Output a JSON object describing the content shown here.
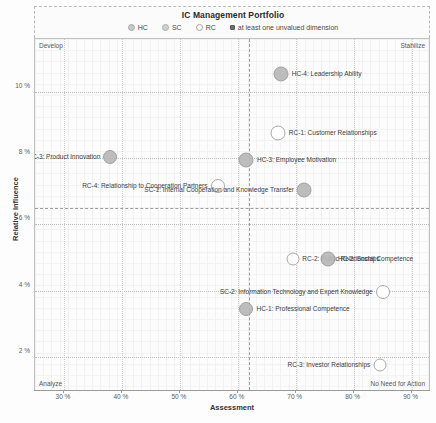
{
  "chart_data": {
    "type": "scatter",
    "title": "IC Management Portfolio",
    "xlabel": "Assessment",
    "ylabel": "Relative Influence",
    "xlim": [
      25,
      93
    ],
    "ylim": [
      1.0,
      11.6
    ],
    "xticks": [
      "30 %",
      "40 %",
      "50 %",
      "60 %",
      "70 %",
      "80 %",
      "90 %"
    ],
    "xtick_values": [
      30,
      40,
      50,
      60,
      70,
      80,
      90
    ],
    "yticks": [
      "2 %",
      "4 %",
      "6 %",
      "8 %",
      "10 %"
    ],
    "ytick_values": [
      2,
      4,
      6,
      8,
      10
    ],
    "grid": true,
    "legend_position": "top",
    "quadrant_divider_x": 62,
    "quadrant_divider_y": 6.5,
    "quadrants": {
      "top_left": "Develop",
      "top_right": "Stabilize",
      "bottom_left": "Analyze",
      "bottom_right": "No Need for Action"
    },
    "legend": [
      {
        "key": "HC",
        "label": "HC",
        "marker": "circle-grey"
      },
      {
        "key": "SC",
        "label": "SC",
        "marker": "circle-grey"
      },
      {
        "key": "RC",
        "label": "RC",
        "marker": "circle-open"
      },
      {
        "key": "unvalued",
        "label": "at least one unvalued dimension",
        "marker": "square-filled"
      }
    ],
    "points": [
      {
        "id": "HC-4",
        "label": "HC-4: Leadership Ability",
        "x": 67.5,
        "y": 10.55,
        "size": 15,
        "fill": "filled",
        "label_side": "right"
      },
      {
        "id": "RC-1",
        "label": "RC-1: Customer Relationships",
        "x": 67.0,
        "y": 8.75,
        "size": 15,
        "fill": "open",
        "label_side": "right"
      },
      {
        "id": "SC-3",
        "label": "SC-3: Product Innovation",
        "x": 38.0,
        "y": 8.05,
        "size": 14,
        "fill": "filled",
        "label_side": "left"
      },
      {
        "id": "HC-3",
        "label": "HC-3: Employee Motivation",
        "x": 61.5,
        "y": 7.95,
        "size": 15,
        "fill": "filled",
        "label_side": "right"
      },
      {
        "id": "RC-4",
        "label": "RC-4: Relationship to Cooperation Partners",
        "x": 56.5,
        "y": 7.15,
        "size": 14,
        "fill": "open",
        "label_side": "left"
      },
      {
        "id": "SC-1",
        "label": "SC-1: Internal  Cooperation and Knowledge Transfer",
        "x": 71.5,
        "y": 7.05,
        "size": 15,
        "fill": "filled",
        "label_side": "left"
      },
      {
        "id": "RC-2",
        "label": "RC-2: Public Relationships",
        "x": 69.5,
        "y": 4.95,
        "size": 13,
        "fill": "open",
        "label_side": "right"
      },
      {
        "id": "HC-2",
        "label": "HC-2: Social Competence",
        "x": 75.5,
        "y": 4.95,
        "size": 15,
        "fill": "filled",
        "label_side": "right"
      },
      {
        "id": "SC-2",
        "label": "SC-2: Information Technology and Expert Knowledge",
        "x": 85.0,
        "y": 3.95,
        "size": 14,
        "fill": "open",
        "label_side": "left"
      },
      {
        "id": "HC-1",
        "label": "HC-1: Professional Competence",
        "x": 61.5,
        "y": 3.45,
        "size": 14,
        "fill": "filled",
        "label_side": "right"
      },
      {
        "id": "RC-3",
        "label": "RC-3: Investor Relationships",
        "x": 84.5,
        "y": 1.75,
        "size": 13,
        "fill": "open",
        "label_side": "left"
      }
    ]
  }
}
